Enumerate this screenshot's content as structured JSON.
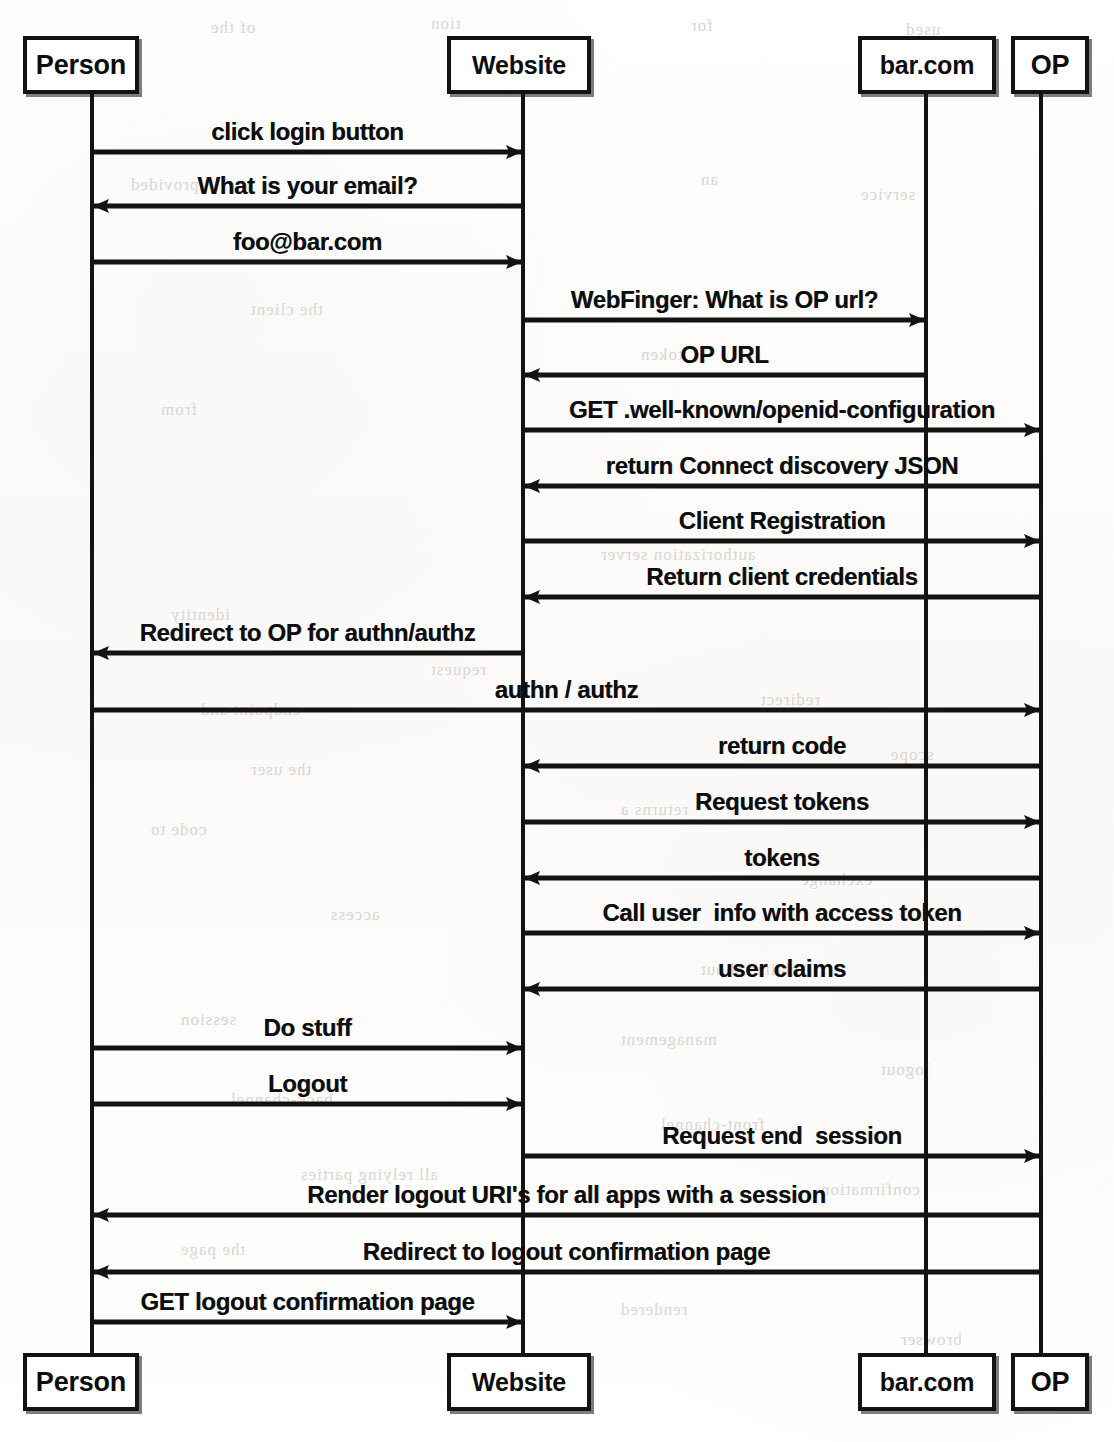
{
  "diagram": {
    "type": "uml-sequence-diagram",
    "colors": {
      "ink": "#131313",
      "paper": "#ffffff",
      "bleed_text": "#d9d6d0"
    },
    "actors": [
      {
        "id": "person",
        "label": "Person",
        "lifeline_x": 92,
        "box_left": 23,
        "box_width": 116,
        "top_box_y": 36,
        "bottom_box_y": 1353,
        "box_height": 58
      },
      {
        "id": "website",
        "label": "Website",
        "lifeline_x": 523,
        "box_left": 447,
        "box_width": 144,
        "top_box_y": 36,
        "bottom_box_y": 1353,
        "box_height": 58
      },
      {
        "id": "barcom",
        "label": "bar.com",
        "lifeline_x": 926,
        "box_left": 858,
        "box_width": 138,
        "top_box_y": 36,
        "bottom_box_y": 1353,
        "box_height": 58
      },
      {
        "id": "op",
        "label": "OP",
        "lifeline_x": 1041,
        "box_left": 1011,
        "box_width": 78,
        "top_box_y": 36,
        "bottom_box_y": 1353,
        "box_height": 58
      }
    ],
    "messages": [
      {
        "index": 1,
        "label": "click login button",
        "from": "person",
        "to": "website",
        "y": 152,
        "direction": "right"
      },
      {
        "index": 2,
        "label": "What is your email?",
        "from": "website",
        "to": "person",
        "y": 206,
        "direction": "left"
      },
      {
        "index": 3,
        "label": "foo@bar.com",
        "from": "person",
        "to": "website",
        "y": 262,
        "direction": "right"
      },
      {
        "index": 4,
        "label": "WebFinger: What is OP url?",
        "from": "website",
        "to": "barcom",
        "y": 320,
        "direction": "right"
      },
      {
        "index": 5,
        "label": "OP URL",
        "from": "barcom",
        "to": "website",
        "y": 375,
        "direction": "left"
      },
      {
        "index": 6,
        "label": "GET .well-known/openid-configuration",
        "from": "website",
        "to": "op",
        "y": 430,
        "direction": "right"
      },
      {
        "index": 7,
        "label": "return Connect discovery JSON",
        "from": "op",
        "to": "website",
        "y": 486,
        "direction": "left"
      },
      {
        "index": 8,
        "label": "Client Registration",
        "from": "website",
        "to": "op",
        "y": 541,
        "direction": "right"
      },
      {
        "index": 9,
        "label": "Return client credentials",
        "from": "op",
        "to": "website",
        "y": 597,
        "direction": "left"
      },
      {
        "index": 10,
        "label": "Redirect to OP for authn/authz",
        "from": "website",
        "to": "person",
        "y": 653,
        "direction": "left"
      },
      {
        "index": 11,
        "label": "authn / authz",
        "from": "person",
        "to": "op",
        "y": 710,
        "direction": "right"
      },
      {
        "index": 12,
        "label": "return code",
        "from": "op",
        "to": "website",
        "y": 766,
        "direction": "left"
      },
      {
        "index": 13,
        "label": "Request tokens",
        "from": "website",
        "to": "op",
        "y": 822,
        "direction": "right"
      },
      {
        "index": 14,
        "label": "tokens",
        "from": "op",
        "to": "website",
        "y": 878,
        "direction": "left"
      },
      {
        "index": 15,
        "label": "Call user  info with access token",
        "from": "website",
        "to": "op",
        "y": 933,
        "direction": "right"
      },
      {
        "index": 16,
        "label": "user claims",
        "from": "op",
        "to": "website",
        "y": 989,
        "direction": "left"
      },
      {
        "index": 17,
        "label": "Do stuff",
        "from": "person",
        "to": "website",
        "y": 1048,
        "direction": "right"
      },
      {
        "index": 18,
        "label": "Logout",
        "from": "person",
        "to": "website",
        "y": 1104,
        "direction": "right"
      },
      {
        "index": 19,
        "label": "Request end  session",
        "from": "website",
        "to": "op",
        "y": 1156,
        "direction": "right"
      },
      {
        "index": 20,
        "label": "Render logout URI's for all apps with a session",
        "from": "op",
        "to": "person",
        "y": 1215,
        "direction": "left"
      },
      {
        "index": 21,
        "label": "Redirect to logout confirmation page",
        "from": "op",
        "to": "person",
        "y": 1272,
        "direction": "left"
      },
      {
        "index": 22,
        "label": "GET logout confirmation page",
        "from": "person",
        "to": "website",
        "y": 1322,
        "direction": "right"
      }
    ],
    "bleed_text": [
      {
        "text": "of the",
        "x": 210,
        "y": 18
      },
      {
        "text": "tion",
        "x": 430,
        "y": 14
      },
      {
        "text": "for",
        "x": 690,
        "y": 16
      },
      {
        "text": "used",
        "x": 905,
        "y": 20
      },
      {
        "text": "provided",
        "x": 130,
        "y": 175
      },
      {
        "text": "an",
        "x": 700,
        "y": 170
      },
      {
        "text": "service",
        "x": 860,
        "y": 185
      },
      {
        "text": "the client",
        "x": 250,
        "y": 300
      },
      {
        "text": "token",
        "x": 640,
        "y": 345
      },
      {
        "text": "from",
        "x": 160,
        "y": 400
      },
      {
        "text": "authorization server",
        "x": 600,
        "y": 545
      },
      {
        "text": "identity",
        "x": 170,
        "y": 605
      },
      {
        "text": "request",
        "x": 430,
        "y": 660
      },
      {
        "text": "redirect",
        "x": 760,
        "y": 690
      },
      {
        "text": "endpoint and",
        "x": 200,
        "y": 700
      },
      {
        "text": "scope",
        "x": 890,
        "y": 745
      },
      {
        "text": "the user",
        "x": 250,
        "y": 760
      },
      {
        "text": "returns a",
        "x": 620,
        "y": 800
      },
      {
        "text": "code to",
        "x": 150,
        "y": 820
      },
      {
        "text": "exchange",
        "x": 800,
        "y": 870
      },
      {
        "text": "access",
        "x": 330,
        "y": 905
      },
      {
        "text": "claims about",
        "x": 700,
        "y": 960
      },
      {
        "text": "session",
        "x": 180,
        "y": 1010
      },
      {
        "text": "management",
        "x": 620,
        "y": 1030
      },
      {
        "text": "logout",
        "x": 880,
        "y": 1060
      },
      {
        "text": "back-channel",
        "x": 230,
        "y": 1090
      },
      {
        "text": "front-channel",
        "x": 660,
        "y": 1115
      },
      {
        "text": "all relying parties",
        "x": 300,
        "y": 1165
      },
      {
        "text": "confirmation",
        "x": 820,
        "y": 1180
      },
      {
        "text": "the page",
        "x": 180,
        "y": 1240
      },
      {
        "text": "rendered",
        "x": 620,
        "y": 1300
      },
      {
        "text": "browser",
        "x": 900,
        "y": 1330
      }
    ]
  }
}
